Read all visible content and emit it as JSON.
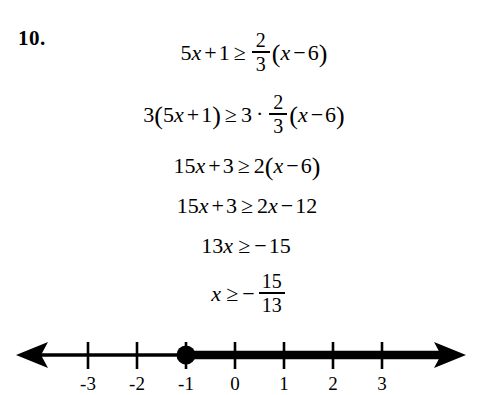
{
  "problem": {
    "number_label": "10."
  },
  "solution_steps": [
    {
      "id": "step-1",
      "lhs": {
        "coef": "5",
        "var": "x",
        "op": "+",
        "const": "1"
      },
      "relation": "≥",
      "rhs_fraction": {
        "numerator": "2",
        "denominator": "3"
      },
      "rhs_group": {
        "open": "(",
        "var": "x",
        "op": "−",
        "const": "6",
        "close": ")"
      },
      "text": "5x + 1 ≥ 2/3(x − 6)"
    },
    {
      "id": "step-2",
      "lhs_multiplier": "3",
      "lhs_group": {
        "open": "(",
        "coef": "5",
        "var": "x",
        "op": "+",
        "const": "1",
        "close": ")"
      },
      "relation": "≥",
      "rhs_multiplier": "3",
      "dot_operator": "·",
      "rhs_fraction": {
        "numerator": "2",
        "denominator": "3"
      },
      "rhs_group": {
        "open": "(",
        "var": "x",
        "op": "−",
        "const": "6",
        "close": ")"
      },
      "text": "3(5x + 1) ≥ 3 · 2/3(x − 6)"
    },
    {
      "id": "step-3",
      "lhs": {
        "coef": "15",
        "var": "x",
        "op": "+",
        "const": "3"
      },
      "relation": "≥",
      "rhs_multiplier": "2",
      "rhs_group": {
        "open": "(",
        "var": "x",
        "op": "−",
        "const": "6",
        "close": ")"
      },
      "text": "15x + 3 ≥ 2(x − 6)"
    },
    {
      "id": "step-4",
      "lhs": {
        "coef": "15",
        "var": "x",
        "op": "+",
        "const": "3"
      },
      "relation": "≥",
      "rhs": {
        "coef": "2",
        "var": "x",
        "op": "−",
        "const": "12"
      },
      "text": "15x + 3 ≥ 2x − 12"
    },
    {
      "id": "step-5",
      "lhs": {
        "coef": "13",
        "var": "x"
      },
      "relation": "≥",
      "rhs": {
        "sign": "−",
        "const": "15"
      },
      "text": "13x ≥ −15"
    },
    {
      "id": "step-6",
      "lhs": {
        "var": "x"
      },
      "relation": "≥",
      "rhs_sign": "−",
      "rhs_fraction": {
        "numerator": "15",
        "denominator": "13"
      },
      "text": "x ≥ −15/13"
    }
  ],
  "number_line": {
    "tick_labels": [
      "-3",
      "-2",
      "-1",
      "0",
      "1",
      "2",
      "3"
    ],
    "tick_values": [
      -3,
      -2,
      -1,
      0,
      1,
      2,
      3
    ],
    "axis_min": -3,
    "axis_max": 3,
    "left_arrow": true,
    "right_arrow": true,
    "solution_point": {
      "value": -1,
      "style": "closed",
      "label": "closed-circle"
    },
    "shaded_ray": {
      "from": -1,
      "direction": "right",
      "inclusive": true
    },
    "stroke_color": "#000000"
  },
  "colors": {
    "ink": "#000000",
    "page": "#ffffff"
  }
}
